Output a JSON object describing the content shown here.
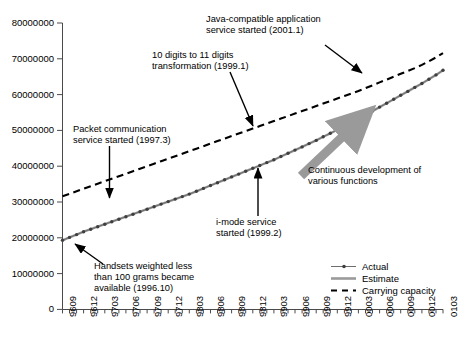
{
  "chart_data": {
    "type": "line",
    "title": "",
    "xlabel": "",
    "ylabel": "",
    "ylim": [
      0,
      80000000
    ],
    "grid": false,
    "legend_position": "bottom-right",
    "ytick_labels": [
      "80000000",
      "70000000",
      "60000000",
      "50000000",
      "40000000",
      "30000000",
      "20000000",
      "10000000",
      "0"
    ],
    "ytick_values": [
      80000000,
      70000000,
      60000000,
      50000000,
      40000000,
      30000000,
      20000000,
      10000000,
      0
    ],
    "x": [
      "9609",
      "9610",
      "9611",
      "9612",
      "9701",
      "9702",
      "9703",
      "9704",
      "9705",
      "9706",
      "9707",
      "9708",
      "9709",
      "9710",
      "9711",
      "9712",
      "9801",
      "9802",
      "9803",
      "9804",
      "9805",
      "9806",
      "9807",
      "9808",
      "9809",
      "9810",
      "9811",
      "9812",
      "9901",
      "9902",
      "9903",
      "9904",
      "9905",
      "9906",
      "9907",
      "9908",
      "9909",
      "9910",
      "9911",
      "9912",
      "0001",
      "0002",
      "0003",
      "0004",
      "0005",
      "0006",
      "0007",
      "0008",
      "0009",
      "0010",
      "0011",
      "0012",
      "0101",
      "0102",
      "0103"
    ],
    "xtick_labels": [
      "9609",
      "9612",
      "9703",
      "9706",
      "9709",
      "9712",
      "9803",
      "9806",
      "9809",
      "9812",
      "9903",
      "9906",
      "9909",
      "9912",
      "0003",
      "0006",
      "0009",
      "0012",
      "0103"
    ],
    "series": [
      {
        "name": "Actual",
        "style": "line-with-markers",
        "color": "#7f7f7f",
        "marker_color": "#3f3f3f",
        "values": [
          19300000,
          20100000,
          20900000,
          21700000,
          22400000,
          23100000,
          23800000,
          24500000,
          25200000,
          25900000,
          26600000,
          27300000,
          28000000,
          28700000,
          29400000,
          30100000,
          30800000,
          31500000,
          32200000,
          33000000,
          33800000,
          34600000,
          35400000,
          36200000,
          37000000,
          37800000,
          38600000,
          39400000,
          40200000,
          41000000,
          41800000,
          42700000,
          43600000,
          44500000,
          45400000,
          46300000,
          47200000,
          48200000,
          49200000,
          50200000,
          51200000,
          52200000,
          53200000,
          54300000,
          55400000,
          56500000,
          57600000,
          58700000,
          59800000,
          60900000,
          62000000,
          63100000,
          64300000,
          65500000,
          66800000
        ]
      },
      {
        "name": "Estimate",
        "style": "solid-thick",
        "color": "#9a9a9a",
        "values": [
          19300000,
          20100000,
          20900000,
          21700000,
          22400000,
          23100000,
          23800000,
          24500000,
          25200000,
          25900000,
          26600000,
          27300000,
          28000000,
          28700000,
          29400000,
          30100000,
          30800000,
          31500000,
          32200000,
          33000000,
          33800000,
          34600000,
          35400000,
          36200000,
          37000000,
          37800000,
          38600000,
          39400000,
          40200000,
          41000000,
          41800000,
          42700000,
          43600000,
          44500000,
          45400000,
          46300000,
          47200000,
          48200000,
          49200000,
          50200000,
          51200000,
          52200000,
          53200000,
          54300000,
          55400000,
          56500000,
          57600000,
          58700000,
          59800000,
          60900000,
          62000000,
          63100000,
          64300000,
          65500000,
          66800000
        ]
      },
      {
        "name": "Carrying capacity",
        "style": "dashed",
        "color": "#000000",
        "values": [
          31600000,
          32300000,
          33000000,
          33700000,
          34400000,
          35100000,
          35800000,
          36500000,
          37200000,
          37900000,
          38600000,
          39300000,
          40000000,
          40700000,
          41400000,
          42100000,
          42800000,
          43500000,
          44200000,
          44900000,
          45600000,
          46300000,
          47000000,
          47700000,
          48400000,
          49100000,
          49800000,
          50500000,
          51200000,
          51900000,
          52600000,
          53300000,
          54000000,
          54700000,
          55400000,
          56100000,
          56800000,
          57500000,
          58200000,
          58900000,
          59600000,
          60300000,
          61000000,
          61800000,
          62600000,
          63400000,
          64200000,
          65000000,
          65800000,
          66600000,
          67400000,
          68300000,
          69300000,
          70400000,
          71600000
        ]
      }
    ],
    "annotations": [
      {
        "name": "java-compatible-application",
        "lines": [
          "Java-compatible application",
          "service started (2001.1)"
        ],
        "arrow": "down-right-to-curve"
      },
      {
        "name": "ten-to-eleven-digits",
        "lines": [
          "10 digits to 11 digits",
          "transformation (1999.1)"
        ],
        "arrow": "down-right-to-curve"
      },
      {
        "name": "packet-communication",
        "lines": [
          "Packet communication",
          "service started (1997.3)"
        ],
        "arrow": "down-to-curve"
      },
      {
        "name": "i-mode-service",
        "lines": [
          "i-mode service",
          "started (1999.2)"
        ],
        "arrow": "up-to-curve"
      },
      {
        "name": "handsets-weighted-less",
        "lines": [
          "Handsets weighted less",
          "than 100 grams became",
          "available (1996.10)"
        ],
        "arrow": "up-left-to-curve"
      },
      {
        "name": "continuous-development",
        "lines": [
          "Continuous development of",
          "various functions"
        ],
        "arrow": "thick-gray-up-right"
      }
    ]
  }
}
